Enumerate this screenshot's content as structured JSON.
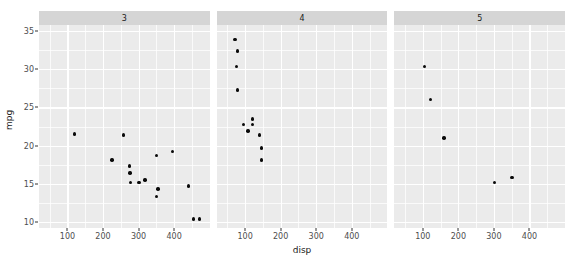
{
  "chart_data": {
    "type": "scatter",
    "title": "",
    "xlabel": "disp",
    "ylabel": "mpg",
    "xlim": [
      20,
      500
    ],
    "ylim": [
      9.2,
      35.8
    ],
    "grid": true,
    "legend": null,
    "facet_variable": "cyl",
    "facet_labels": [
      "3",
      "4",
      "5"
    ],
    "x_ticks": [
      100,
      200,
      300,
      400
    ],
    "x_tick_labels": [
      "100",
      "200",
      "300",
      "400"
    ],
    "x_minor_ticks": [
      50,
      150,
      250,
      350,
      450
    ],
    "y_ticks": [
      10,
      15,
      20,
      25,
      30,
      35
    ],
    "y_tick_labels": [
      "10",
      "15",
      "20",
      "25",
      "30",
      "35"
    ],
    "y_minor_ticks": [
      12.5,
      17.5,
      22.5,
      27.5,
      32.5
    ],
    "panels": [
      {
        "label": "3",
        "points": [
          {
            "x": 120,
            "y": 21.5
          },
          {
            "x": 258,
            "y": 21.4
          },
          {
            "x": 225,
            "y": 18.1
          },
          {
            "x": 275,
            "y": 17.3
          },
          {
            "x": 276,
            "y": 16.4
          },
          {
            "x": 277,
            "y": 15.2
          },
          {
            "x": 301,
            "y": 15.2
          },
          {
            "x": 318,
            "y": 15.5
          },
          {
            "x": 351,
            "y": 18.7
          },
          {
            "x": 355,
            "y": 14.3
          },
          {
            "x": 350,
            "y": 13.3
          },
          {
            "x": 396,
            "y": 19.2
          },
          {
            "x": 441,
            "y": 14.7
          },
          {
            "x": 455,
            "y": 10.4
          },
          {
            "x": 472,
            "y": 10.4
          }
        ]
      },
      {
        "label": "4",
        "points": [
          {
            "x": 71,
            "y": 33.9
          },
          {
            "x": 79,
            "y": 32.4
          },
          {
            "x": 76,
            "y": 30.4
          },
          {
            "x": 78,
            "y": 27.3
          },
          {
            "x": 121,
            "y": 23.5
          },
          {
            "x": 96,
            "y": 22.8
          },
          {
            "x": 120,
            "y": 22.8
          },
          {
            "x": 108,
            "y": 21.9
          },
          {
            "x": 141,
            "y": 21.4
          },
          {
            "x": 146,
            "y": 19.7
          },
          {
            "x": 146,
            "y": 18.1
          }
        ]
      },
      {
        "label": "5",
        "points": [
          {
            "x": 105,
            "y": 30.4
          },
          {
            "x": 121,
            "y": 26.0
          },
          {
            "x": 160,
            "y": 21.0
          },
          {
            "x": 301,
            "y": 15.2
          },
          {
            "x": 351,
            "y": 15.8
          }
        ]
      }
    ]
  },
  "axis": {
    "y_title": "mpg",
    "x_title": "disp"
  }
}
